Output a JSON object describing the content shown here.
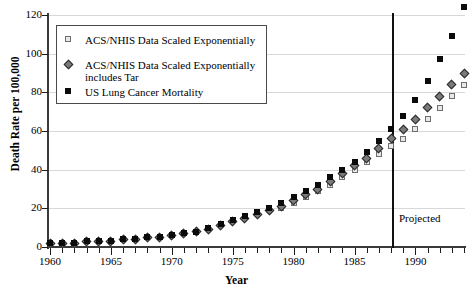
{
  "chart_data": {
    "type": "scatter",
    "title": "",
    "xlabel": "Year",
    "ylabel": "Death Rate per 100,000",
    "xlim": [
      1959.5,
      1994.5
    ],
    "ylim": [
      0,
      120
    ],
    "grid": true,
    "legend_position": "top-left",
    "x_ticks_major": [
      1960,
      1965,
      1970,
      1975,
      1980,
      1985,
      1990
    ],
    "y_ticks": [
      0,
      20,
      40,
      60,
      80,
      100,
      120
    ],
    "x": [
      1960,
      1961,
      1962,
      1963,
      1964,
      1965,
      1966,
      1967,
      1968,
      1969,
      1970,
      1971,
      1972,
      1973,
      1974,
      1975,
      1976,
      1977,
      1978,
      1979,
      1980,
      1981,
      1982,
      1983,
      1984,
      1985,
      1986,
      1987,
      1988,
      1989,
      1990,
      1991,
      1992,
      1993,
      1994
    ],
    "annotations": [
      {
        "text": "Projected",
        "x": 1988.6,
        "y": 18
      }
    ],
    "reference_lines": [
      {
        "orientation": "vertical",
        "x": 1988,
        "label": "Projected"
      }
    ],
    "series": [
      {
        "name": "ACS/NHIS Data Scaled Exponentially",
        "marker": "open-square",
        "color": "#e8e8e8",
        "edge_color": "#6d6d6d",
        "values": [
          null,
          null,
          null,
          null,
          null,
          null,
          null,
          null,
          null,
          null,
          null,
          null,
          null,
          null,
          null,
          null,
          null,
          null,
          null,
          20,
          23,
          26,
          29,
          32,
          36,
          40,
          44,
          48,
          52,
          56,
          61,
          66,
          72,
          78,
          84
        ]
      },
      {
        "name": "ACS/NHIS Data Scaled Exponentially includes Tar",
        "marker": "diamond",
        "color": "#7a7a7a",
        "edge_color": "#2b2b2b",
        "values": [
          2,
          2,
          2,
          3,
          3,
          3,
          4,
          4,
          5,
          5,
          6,
          7,
          8,
          9,
          11,
          13,
          15,
          17,
          19,
          21,
          24,
          27,
          30,
          34,
          38,
          42,
          46,
          51,
          56,
          61,
          66,
          72,
          78,
          84,
          90
        ]
      },
      {
        "name": "US Lung Cancer Mortality",
        "marker": "filled-square",
        "color": "#0b0b0b",
        "edge_color": "#0b0b0b",
        "values": [
          2,
          2,
          2,
          3,
          3,
          3,
          4,
          4,
          5,
          5,
          6,
          7,
          8,
          10,
          12,
          14,
          16,
          18,
          20,
          23,
          26,
          29,
          32,
          36,
          40,
          44,
          49,
          55,
          61,
          68,
          76,
          86,
          97,
          109,
          124
        ]
      }
    ]
  },
  "legend": {
    "items": [
      {
        "marker": "open-square",
        "label": "ACS/NHIS Data Scaled Exponentially",
        "label2": ""
      },
      {
        "marker": "diamond",
        "label": "ACS/NHIS Data Scaled Exponentially",
        "label2": "includes Tar"
      },
      {
        "marker": "filled-square",
        "label": "US Lung Cancer Mortality",
        "label2": ""
      }
    ]
  },
  "axes": {
    "y_title": "Death Rate per 100,000",
    "x_title": "Year",
    "y_tick_labels": [
      "120",
      "100",
      "80",
      "60",
      "40",
      "20",
      "0"
    ],
    "x_tick_labels": [
      "1960",
      "1965",
      "1970",
      "1975",
      "1980",
      "1985",
      "1990"
    ]
  },
  "projection": {
    "label": "Projected",
    "year": 1988
  },
  "colors": {
    "grid": "#d8d8d8",
    "axis": "#3a3a3a",
    "legend_border": "#4a4a4a",
    "projection_line": "#101010"
  }
}
